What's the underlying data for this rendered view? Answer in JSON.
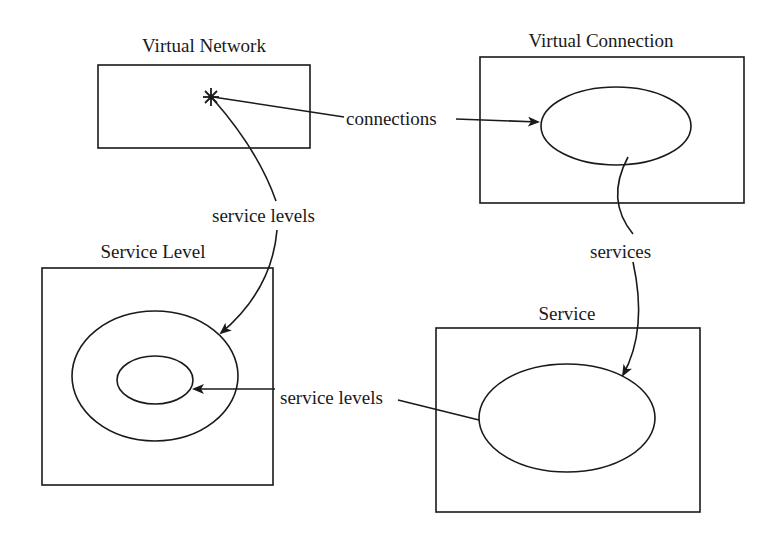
{
  "diagram": {
    "nodes": {
      "virtual_network": {
        "title": "Virtual Network"
      },
      "virtual_connection": {
        "title": "Virtual Connection"
      },
      "service_level": {
        "title": "Service Level"
      },
      "service": {
        "title": "Service"
      }
    },
    "edges": {
      "connections": {
        "label": "connections",
        "from": "Virtual Network",
        "to": "Virtual Connection"
      },
      "vn_service_levels": {
        "label": "service levels",
        "from": "Virtual Network",
        "to": "Service Level"
      },
      "services": {
        "label": "services",
        "from": "Virtual Connection",
        "to": "Service"
      },
      "svc_service_levels": {
        "label": "service levels",
        "from": "Service",
        "to": "Service Level"
      }
    },
    "colors": {
      "stroke": "#1a1a1a",
      "background": "#ffffff"
    }
  }
}
